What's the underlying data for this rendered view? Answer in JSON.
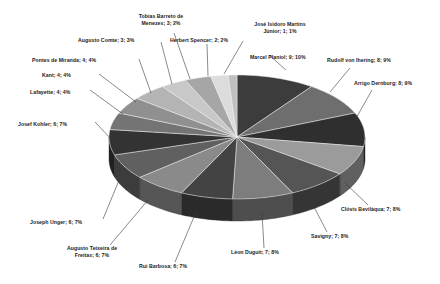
{
  "chart_data": {
    "type": "pie",
    "title": "",
    "subtitle": "",
    "xlabel": "",
    "ylabel": "",
    "legend": "none",
    "grid": false,
    "label_format": "name; count; percent",
    "total_count": 92,
    "categories": [
      "Marcel Planiol",
      "Rudolf von Ihering",
      "Arrigo Dernburg",
      "Clóvis Beviláqua",
      "Savigny",
      "Léon Duguit",
      "Rui Barbosa",
      "Augusto Teixeira de Freitas",
      "Joseph Unger",
      "Josef Kohler",
      "Lafayette",
      "Kant",
      "Pontes de Miranda",
      "Augusto Comte",
      "Tobias Barreto de Menezes",
      "Herbert Spencer",
      "José Isidoro Martins Júnior"
    ],
    "values": [
      9,
      8,
      8,
      7,
      7,
      7,
      6,
      6,
      6,
      6,
      4,
      4,
      4,
      3,
      3,
      2,
      1
    ],
    "percents": [
      10,
      9,
      9,
      8,
      8,
      8,
      7,
      7,
      7,
      7,
      4,
      4,
      4,
      3,
      3,
      2,
      1
    ],
    "colors": [
      "#3c3c3c",
      "#6e6e6e",
      "#2f2f2f",
      "#9b9b9b",
      "#555555",
      "#7d7d7d",
      "#434343",
      "#8a8a8a",
      "#606060",
      "#333333",
      "#747474",
      "#909090",
      "#b4b4b4",
      "#c8c8c8",
      "#a6a6a6",
      "#dcdcdc",
      "#bfbfbf"
    ]
  },
  "labels": [
    {
      "name": "label-tobias-barreto-de-menezes",
      "line1": "Tobias Barreto de",
      "line2": "Menezes; 3; 2%"
    },
    {
      "name": "label-augusto-comte",
      "line1": "Augusto Comte; 3; 3%",
      "line2": ""
    },
    {
      "name": "label-herbert-spencer",
      "line1": "Herbert Spencer; 2; 2%",
      "line2": ""
    },
    {
      "name": "label-jose-isidoro-martins-junior",
      "line1": "José Isidoro Martins",
      "line2": "Júnior; 1; 1%"
    },
    {
      "name": "label-marcel-planiol",
      "line1": "Marcel Planiol; 9; 10%",
      "line2": ""
    },
    {
      "name": "label-rudolf-von-ihering",
      "line1": "Rudolf von Ihering; 8; 9%",
      "line2": ""
    },
    {
      "name": "label-arrigo-dernburg",
      "line1": "Arrigo Dernburg; 8; 9%",
      "line2": ""
    },
    {
      "name": "label-pontes-de-miranda",
      "line1": "Pontes de Miranda; 4; 4%",
      "line2": ""
    },
    {
      "name": "label-kant",
      "line1": "Kant; 4; 4%",
      "line2": ""
    },
    {
      "name": "label-lafayette",
      "line1": "Lafayette; 4; 4%",
      "line2": ""
    },
    {
      "name": "label-josef-kohler",
      "line1": "Josef Kohler; 6; 7%",
      "line2": ""
    },
    {
      "name": "label-joseph-unger",
      "line1": "Joseph Unger; 6; 7%",
      "line2": ""
    },
    {
      "name": "label-augusto-teixeira-de-freitas",
      "line1": "Augusto Teixeira de",
      "line2": "Freitas; 6; 7%"
    },
    {
      "name": "label-rui-barbosa",
      "line1": "Rui Barbosa; 6; 7%",
      "line2": ""
    },
    {
      "name": "label-leon-duguit",
      "line1": "Léon Duguit; 7; 8%",
      "line2": ""
    },
    {
      "name": "label-savigny",
      "line1": "Savigny; 7; 8%",
      "line2": ""
    },
    {
      "name": "label-clovis-bevilaqua",
      "line1": "Clóvis Beviláqua; 7; 8%",
      "line2": ""
    }
  ]
}
